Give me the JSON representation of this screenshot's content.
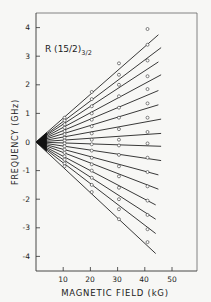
{
  "chart_data": {
    "type": "line",
    "title_subscript": "3/2",
    "xlabel": "MAGNETIC FIELD (kG)",
    "ylabel": "FREQUENCY (GHz)",
    "xlim": [
      0,
      58
    ],
    "ylim": [
      -4.5,
      4.5
    ],
    "xticks": [
      10,
      20,
      30,
      40,
      50
    ],
    "yticks": [
      4,
      3,
      2,
      1,
      0,
      -1,
      -2,
      -3,
      -4
    ],
    "grid": false,
    "legend": null,
    "series_description": "16 straight Zeeman lines fanning from origin (0,0); open-circle measured points at ~10, 20, 30, 41 kG",
    "lines": [
      {
        "name": "upper-1",
        "x_end": 45,
        "y_end": 3.75
      },
      {
        "name": "upper-2",
        "x_end": 46,
        "y_end": 3.3
      },
      {
        "name": "upper-3",
        "x_end": 45,
        "y_end": 2.8
      },
      {
        "name": "upper-4",
        "x_end": 46,
        "y_end": 2.35
      },
      {
        "name": "upper-5",
        "x_end": 45,
        "y_end": 1.8
      },
      {
        "name": "upper-6",
        "x_end": 45,
        "y_end": 1.3
      },
      {
        "name": "upper-7",
        "x_end": 46,
        "y_end": 0.8
      },
      {
        "name": "upper-8",
        "x_end": 46,
        "y_end": 0.3
      },
      {
        "name": "lower-1",
        "x_end": 46,
        "y_end": -0.15
      },
      {
        "name": "lower-2",
        "x_end": 46,
        "y_end": -0.65
      },
      {
        "name": "lower-3",
        "x_end": 45,
        "y_end": -1.15
      },
      {
        "name": "lower-4",
        "x_end": 45,
        "y_end": -1.65
      },
      {
        "name": "lower-5",
        "x_end": 44,
        "y_end": -2.2
      },
      {
        "name": "lower-6",
        "x_end": 44,
        "y_end": -2.7
      },
      {
        "name": "lower-7",
        "x_end": 44,
        "y_end": -3.2
      },
      {
        "name": "lower-8",
        "x_end": 44,
        "y_end": -3.9
      }
    ],
    "points": [
      {
        "x": 10.5,
        "y": [
          0.85,
          0.75,
          0.62,
          0.5,
          0.38,
          0.27,
          0.15,
          0.05,
          -0.05,
          -0.15,
          -0.27,
          -0.38,
          -0.5,
          -0.62,
          -0.75,
          -0.85
        ]
      },
      {
        "x": 20.5,
        "y": [
          1.75,
          1.5,
          1.25,
          1.0,
          0.78,
          0.55,
          0.3,
          0.08,
          -0.08,
          -0.3,
          -0.55,
          -0.78,
          -1.0,
          -1.25,
          -1.5,
          -1.75
        ]
      },
      {
        "x": 30.5,
        "y": [
          2.75,
          2.35,
          2.0,
          1.6,
          1.2,
          0.85,
          0.45,
          0.08,
          -0.12,
          -0.45,
          -0.85,
          -1.2,
          -1.6,
          -2.0,
          -2.35,
          -2.7
        ]
      },
      {
        "x": 41,
        "y": [
          3.95,
          3.4,
          2.85,
          2.3,
          1.85,
          1.35,
          0.85,
          0.35,
          -0.05,
          -0.55,
          -1.05,
          -1.55,
          -2.05,
          -2.55,
          -3.05,
          -3.5
        ]
      }
    ]
  },
  "labels": {
    "title_main": "R (15/2)",
    "title_sub": "3/2",
    "xlabel": "MAGNETIC FIELD (kG)",
    "ylabel": "FREQUENCY (GHz)",
    "xtick_10": "10",
    "xtick_20": "20",
    "xtick_30": "30",
    "xtick_40": "40",
    "xtick_50": "50",
    "ytick_4": "4",
    "ytick_3": "3",
    "ytick_2": "2",
    "ytick_1": "1",
    "ytick_0": "0",
    "ytick_m1": "-1",
    "ytick_m2": "-2",
    "ytick_m3": "-3",
    "ytick_m4": "-4"
  },
  "colors": {
    "ink": "#222222",
    "frame": "#555555",
    "background": "#f7f7f5"
  }
}
